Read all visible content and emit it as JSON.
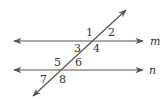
{
  "diagram": {
    "line_color": "#555555",
    "lines": {
      "m": {
        "label": "m",
        "y": 41
      },
      "n": {
        "label": "n",
        "y": 70
      }
    },
    "angles": [
      {
        "id": "1",
        "label": "1"
      },
      {
        "id": "2",
        "label": "2"
      },
      {
        "id": "3",
        "label": "3"
      },
      {
        "id": "4",
        "label": "4"
      },
      {
        "id": "5",
        "label": "5"
      },
      {
        "id": "6",
        "label": "6"
      },
      {
        "id": "7",
        "label": "7"
      },
      {
        "id": "8",
        "label": "8"
      }
    ]
  }
}
